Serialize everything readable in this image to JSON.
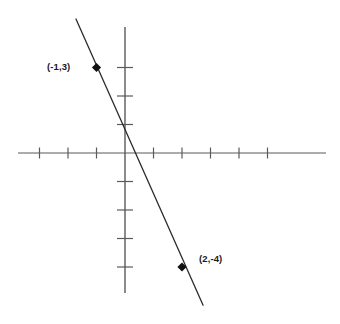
{
  "figure": {
    "background_color": "#ffffff"
  },
  "chart_data": {
    "type": "line",
    "title": "",
    "subtitle": "",
    "xlabel": "",
    "ylabel": "",
    "grid": false,
    "legend": null,
    "axis_color": "#5a5a5a",
    "line_color": "#2b2b2b",
    "marker_color": "#111111",
    "label_color": "#1a1a1a",
    "origin_px": {
      "x": 125,
      "y": 153
    },
    "unit_px": 28.5,
    "xlim": [
      -3.8,
      7.1
    ],
    "ylim": [
      -4.9,
      4.4
    ],
    "x_ticks": [
      -3,
      -2,
      -1,
      1,
      2,
      3,
      4,
      5
    ],
    "y_ticks": [
      3,
      2,
      1,
      -1,
      -2,
      -3,
      -4
    ],
    "x_tick_labels": [
      "",
      "",
      "",
      "",
      "",
      "",
      "",
      ""
    ],
    "y_tick_labels": [
      "",
      "",
      "",
      "",
      "",
      "",
      ""
    ],
    "series": [
      {
        "name": "line",
        "equation": "y = -7/3 x + 2/3",
        "slope": -2.3333,
        "intercept": 0.6667,
        "endpoints": [
          {
            "x": -1.72,
            "y": 4.7
          },
          {
            "x": 2.74,
            "y": -5.34
          }
        ]
      }
    ],
    "points": [
      {
        "x": -1,
        "y": 3,
        "label": "(-1,3)",
        "label_position": "left"
      },
      {
        "x": 2,
        "y": -4,
        "label": "(2,-4)",
        "label_position": "right"
      }
    ],
    "axes": {
      "x_axis": {
        "start_px": 18,
        "end_px": 326,
        "y_px": 153,
        "tick_half_len_px": 5.5
      },
      "y_axis": {
        "start_px": 27,
        "end_px": 293,
        "x_px": 125,
        "tick_half_len_px": 8
      }
    }
  }
}
